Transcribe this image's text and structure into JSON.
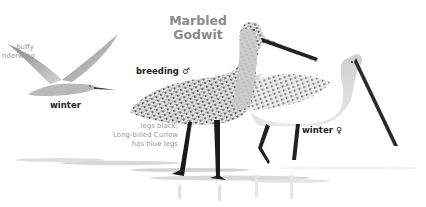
{
  "species": {
    "title_line1": "Marbled",
    "title_line2": "Godwit"
  },
  "labels": {
    "breeding_male": "breeding ♂",
    "winter_female": "winter ♀",
    "winter_flight": "winter",
    "underwing_line1": "buffy",
    "underwing_line2": "nderwing",
    "legs_line1": "legs black;",
    "legs_line2": "Long-billed Curlew",
    "legs_line3": "has blue legs"
  },
  "figures": [
    {
      "name": "flying-godwit-winter",
      "pose": "flight"
    },
    {
      "name": "standing-godwit-breeding-male",
      "pose": "standing"
    },
    {
      "name": "standing-godwit-winter-female",
      "pose": "standing"
    }
  ],
  "colors": {
    "title": "#8a8a8a",
    "label": "#222222",
    "note": "#9a9a9a",
    "plumage_dark": "#3a3a3a",
    "plumage_light": "#d8d8d8",
    "water": "#e6e6e6"
  }
}
